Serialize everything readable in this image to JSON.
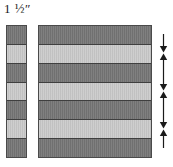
{
  "figure": {
    "width": 173,
    "height": 167,
    "background_color": "#ffffff"
  },
  "measurement": {
    "label": "1 ½″",
    "value": "1 1/2",
    "unit": "inch",
    "describes": "finished strip width"
  },
  "palette": {
    "fabric_dark": "#767676",
    "fabric_light": "#c9c9c9",
    "seam_line": "#3f3f3f",
    "outline": "#4a4a4a",
    "arrow": "#1a1a1a"
  },
  "strip_unit": {
    "name": "strip-unit",
    "orientation": "vertical",
    "band_count": 7,
    "bands": [
      {
        "index": 1,
        "shade": "dark",
        "color": "#767676"
      },
      {
        "index": 2,
        "shade": "light",
        "color": "#c9c9c9"
      },
      {
        "index": 3,
        "shade": "dark",
        "color": "#767676"
      },
      {
        "index": 4,
        "shade": "light",
        "color": "#c9c9c9"
      },
      {
        "index": 5,
        "shade": "dark",
        "color": "#767676"
      },
      {
        "index": 6,
        "shade": "light",
        "color": "#c9c9c9"
      },
      {
        "index": 7,
        "shade": "dark",
        "color": "#767676"
      }
    ]
  },
  "pieced_block": {
    "name": "pieced-block",
    "orientation": "horizontal",
    "stripe_count": 7,
    "stripes": [
      {
        "index": 1,
        "shade": "dark",
        "color": "#767676"
      },
      {
        "index": 2,
        "shade": "light",
        "color": "#c9c9c9"
      },
      {
        "index": 3,
        "shade": "dark",
        "color": "#767676"
      },
      {
        "index": 4,
        "shade": "light",
        "color": "#c9c9c9"
      },
      {
        "index": 5,
        "shade": "dark",
        "color": "#767676"
      },
      {
        "index": 6,
        "shade": "light",
        "color": "#c9c9c9"
      },
      {
        "index": 7,
        "shade": "dark",
        "color": "#767676"
      }
    ]
  },
  "press_arrows": {
    "name": "press-arrows",
    "count": 6,
    "items": [
      {
        "index": 1,
        "direction": "down",
        "glyph": "↓",
        "seam_after_stripe": 1
      },
      {
        "index": 2,
        "direction": "up",
        "glyph": "↑",
        "seam_after_stripe": 2
      },
      {
        "index": 3,
        "direction": "down",
        "glyph": "↓",
        "seam_after_stripe": 3
      },
      {
        "index": 4,
        "direction": "up",
        "glyph": "↑",
        "seam_after_stripe": 4
      },
      {
        "index": 5,
        "direction": "down",
        "glyph": "↓",
        "seam_after_stripe": 5
      },
      {
        "index": 6,
        "direction": "up",
        "glyph": "↑",
        "seam_after_stripe": 6
      }
    ]
  }
}
